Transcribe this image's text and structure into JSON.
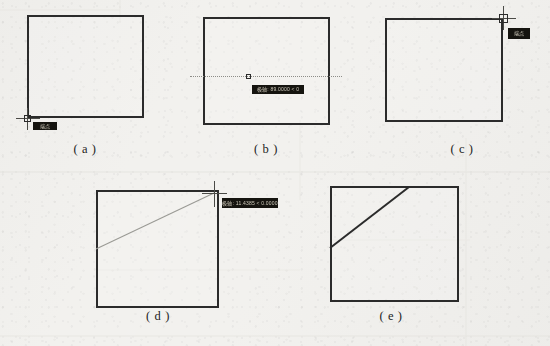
{
  "figure": {
    "title": "",
    "domain_note": "CAD object-snap drawing sequence",
    "background_color": "#f3f2ef",
    "ink_color": "#2b2b2b",
    "tooltip_bg": "#15140f",
    "tooltip_fg": "#cfcabb",
    "track_color": "#8d8d88"
  },
  "panels": [
    {
      "id": "a",
      "caption": "( a )",
      "square": {
        "x": 27,
        "y": 15,
        "w": 117,
        "h": 103
      },
      "snap": {
        "type": "endpoint",
        "marker_name": "endpoint-snap-marker",
        "x": 27,
        "y": 118,
        "size": 7
      },
      "tooltip": {
        "text": "端点",
        "x": 33,
        "y": 122,
        "w": 24,
        "h": 8
      },
      "crosshair": {
        "cx": 27,
        "cy": 118,
        "arm": 12
      }
    },
    {
      "id": "b",
      "caption": "( b )",
      "square": {
        "x": 203,
        "y": 17,
        "w": 127,
        "h": 108
      },
      "snap": {
        "type": "midpoint",
        "marker_name": "midpoint-snap-marker",
        "x": 248,
        "y": 76,
        "size": 5
      },
      "tooltip": {
        "text": "极轴: 89.0000 < 0",
        "x": 252,
        "y": 85,
        "w": 52,
        "h": 9
      },
      "track": {
        "x": 190,
        "y": 76,
        "w": 152
      }
    },
    {
      "id": "c",
      "caption": "( c )",
      "square": {
        "x": 385,
        "y": 18,
        "w": 118,
        "h": 104
      },
      "snap": {
        "type": "endpoint",
        "marker_name": "endpoint-snap-marker",
        "x": 499,
        "y": 14,
        "size": 9
      },
      "tooltip": {
        "text": "端点",
        "x": 508,
        "y": 28,
        "w": 22,
        "h": 11
      },
      "crosshair": {
        "cx": 503,
        "cy": 18,
        "arm": 14
      }
    },
    {
      "id": "d",
      "caption": "( d )",
      "square": {
        "x": 96,
        "y": 190,
        "w": 123,
        "h": 118
      },
      "rubber_band": {
        "x1": 96,
        "y1": 249,
        "x2": 214,
        "y2": 193
      },
      "tooltip": {
        "text": "极轴: 11.4385 < 0.0000",
        "x": 222,
        "y": 198,
        "w": 56,
        "h": 10
      },
      "crosshair": {
        "cx": 214,
        "cy": 193,
        "arm": 13
      }
    },
    {
      "id": "e",
      "caption": "( e )",
      "square": {
        "x": 330,
        "y": 186,
        "w": 129,
        "h": 116
      },
      "result_line": {
        "x1": 330,
        "y1": 248,
        "x2": 409,
        "y2": 187
      }
    }
  ],
  "captions": {
    "a": "( a )",
    "b": "( b )",
    "c": "( c )",
    "d": "( d )",
    "e": "( e )"
  },
  "caption_positions": [
    {
      "id": "a",
      "x": 85,
      "y": 148
    },
    {
      "id": "b",
      "x": 266,
      "y": 148
    },
    {
      "id": "c",
      "x": 462,
      "y": 148
    },
    {
      "id": "d",
      "x": 158,
      "y": 315
    },
    {
      "id": "e",
      "x": 391,
      "y": 315
    }
  ]
}
